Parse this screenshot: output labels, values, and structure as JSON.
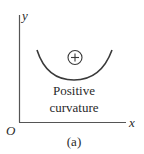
{
  "diagram": {
    "axes": {
      "y_label": "y",
      "x_label": "x",
      "origin_label": "O"
    },
    "curve": {
      "shape": "concave-up arc",
      "sign_symbol": "+",
      "description": [
        "Positive",
        "curvature"
      ]
    },
    "caption": "(a)",
    "colors": {
      "stroke": "#3a3a3a",
      "axis": "#555555",
      "background": "#ffffff"
    }
  }
}
